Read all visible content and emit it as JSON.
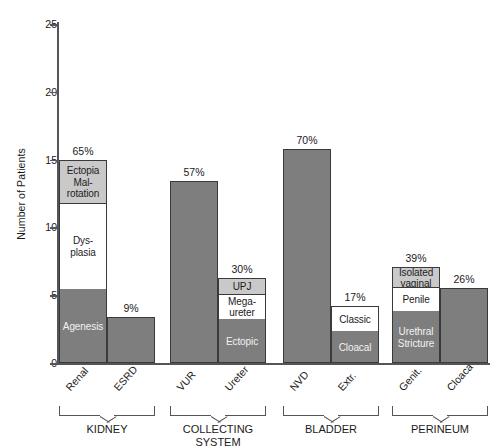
{
  "chart_data": {
    "type": "bar",
    "title": "",
    "xlabel": "",
    "ylabel": "Number of Patients",
    "ylim": [
      0,
      25
    ],
    "yticks": [
      0,
      5,
      10,
      15,
      20,
      25
    ],
    "grid": false,
    "legend": "none",
    "stacked": true,
    "groups": [
      {
        "name": "KIDNEY",
        "bars": [
          {
            "category": "Renal",
            "total": 15.0,
            "pct_label": "65%",
            "segments": [
              {
                "label": "Ectopia Mal-rotation",
                "lines": [
                  "Ectopia",
                  "Mal-",
                  "rotation"
                ],
                "value": 3.2,
                "fill": "light"
              },
              {
                "label": "Dysplasia",
                "lines": [
                  "Dys-",
                  "plasia"
                ],
                "value": 6.3,
                "fill": "white"
              },
              {
                "label": "Agenesis",
                "lines": [
                  "Agenesis"
                ],
                "value": 5.5,
                "fill": "grey"
              }
            ]
          },
          {
            "category": "ESRD",
            "total": 3.4,
            "pct_label": "9%",
            "segments": [
              {
                "label": "",
                "lines": [],
                "value": 3.4,
                "fill": "plain"
              }
            ]
          }
        ]
      },
      {
        "name": "COLLECTING SYSTEM",
        "bars": [
          {
            "category": "VUR",
            "total": 13.4,
            "pct_label": "57%",
            "segments": [
              {
                "label": "",
                "lines": [],
                "value": 13.4,
                "fill": "plain"
              }
            ]
          },
          {
            "category": "Ureter",
            "total": 6.3,
            "pct_label": "30%",
            "segments": [
              {
                "label": "UPJ",
                "lines": [
                  "UPJ"
                ],
                "value": 1.2,
                "fill": "light"
              },
              {
                "label": "Mega-ureter",
                "lines": [
                  "Mega-",
                  "ureter"
                ],
                "value": 1.8,
                "fill": "white"
              },
              {
                "label": "Ectopic",
                "lines": [
                  "Ectopic"
                ],
                "value": 3.3,
                "fill": "grey"
              }
            ]
          }
        ]
      },
      {
        "name": "BLADDER",
        "bars": [
          {
            "category": "NVD",
            "total": 15.8,
            "pct_label": "70%",
            "segments": [
              {
                "label": "",
                "lines": [],
                "value": 15.8,
                "fill": "plain"
              }
            ]
          },
          {
            "category": "Extr.",
            "total": 4.2,
            "pct_label": "17%",
            "segments": [
              {
                "label": "Classic",
                "lines": [
                  "Classic"
                ],
                "value": 1.8,
                "fill": "white"
              },
              {
                "label": "Cloacal",
                "lines": [
                  "Cloacal"
                ],
                "value": 2.4,
                "fill": "grey"
              }
            ]
          }
        ]
      },
      {
        "name": "PERINEUM",
        "bars": [
          {
            "category": "Genit.",
            "total": 7.1,
            "pct_label": "39%",
            "segments": [
              {
                "label": "Isolated vaginal",
                "lines": [
                  "Isolated",
                  "vaginal"
                ],
                "value": 1.5,
                "fill": "light"
              },
              {
                "label": "Penile",
                "lines": [
                  "Penile"
                ],
                "value": 1.7,
                "fill": "white"
              },
              {
                "label": "Urethral Stricture",
                "lines": [
                  "Urethral",
                  "Stricture"
                ],
                "value": 3.9,
                "fill": "grey"
              }
            ]
          },
          {
            "category": "Cloaca",
            "total": 5.5,
            "pct_label": "26%",
            "segments": [
              {
                "label": "",
                "lines": [],
                "value": 5.5,
                "fill": "plain"
              }
            ]
          }
        ]
      }
    ],
    "colors": {
      "bar_grey": "#7e7e7e",
      "bar_light": "#c9c9c9",
      "bar_white": "#ffffff",
      "outline": "#3a3a3a",
      "axis": "#555555",
      "text": "#1a1a1a"
    }
  }
}
